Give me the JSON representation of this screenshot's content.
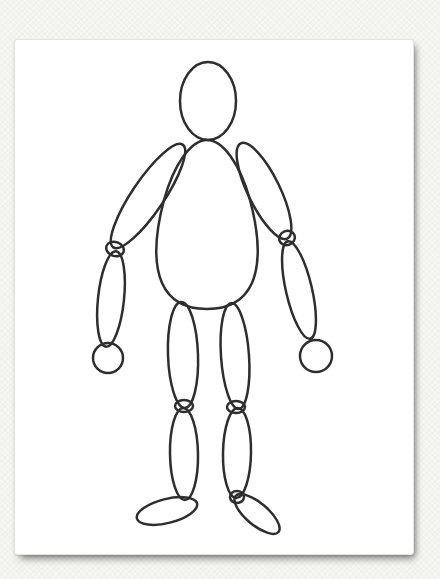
{
  "canvas": {
    "background_color": "#f7f7f4",
    "card_color": "#ffffff",
    "stroke_color": "#2e2e2e",
    "stroke_width": 2.5
  },
  "figure": {
    "parts": [
      {
        "name": "head",
        "shape": "ellipse",
        "cx": 208,
        "cy": 101,
        "rx": 28,
        "ry": 39,
        "rotate": 0
      },
      {
        "name": "torso",
        "shape": "path",
        "d": "M 207,140 C 191,140 174,164 164,200 C 156,230 153,262 162,283 C 171,303 189,309 207,309 C 225,309 243,303 252,283 C 261,262 258,230 250,200 C 240,164 223,140 207,140 Z"
      },
      {
        "name": "left-upper-arm",
        "shape": "ellipse",
        "cx": 148,
        "cy": 196,
        "rx": 16,
        "ry": 62,
        "rotate": 34
      },
      {
        "name": "right-upper-arm",
        "shape": "ellipse",
        "cx": 264,
        "cy": 191,
        "rx": 16,
        "ry": 53,
        "rotate": -26
      },
      {
        "name": "left-elbow-joint",
        "shape": "ellipse",
        "cx": 115,
        "cy": 249,
        "rx": 9,
        "ry": 7,
        "rotate": 20
      },
      {
        "name": "right-elbow-joint",
        "shape": "ellipse",
        "cx": 287,
        "cy": 238,
        "rx": 8,
        "ry": 7,
        "rotate": -20
      },
      {
        "name": "left-forearm",
        "shape": "ellipse",
        "cx": 111,
        "cy": 299,
        "rx": 13,
        "ry": 48,
        "rotate": 6
      },
      {
        "name": "right-forearm",
        "shape": "ellipse",
        "cx": 299,
        "cy": 290,
        "rx": 13,
        "ry": 50,
        "rotate": -13
      },
      {
        "name": "left-hand",
        "shape": "ellipse",
        "cx": 108,
        "cy": 358,
        "rx": 15,
        "ry": 15,
        "rotate": 0
      },
      {
        "name": "right-hand",
        "shape": "ellipse",
        "cx": 316,
        "cy": 356,
        "rx": 16,
        "ry": 16,
        "rotate": 0
      },
      {
        "name": "left-thigh",
        "shape": "ellipse",
        "cx": 183,
        "cy": 355,
        "rx": 15,
        "ry": 53,
        "rotate": -2
      },
      {
        "name": "right-thigh",
        "shape": "ellipse",
        "cx": 235,
        "cy": 356,
        "rx": 14,
        "ry": 53,
        "rotate": -4
      },
      {
        "name": "left-knee-joint",
        "shape": "ellipse",
        "cx": 184,
        "cy": 406,
        "rx": 9,
        "ry": 6,
        "rotate": 0
      },
      {
        "name": "right-knee-joint",
        "shape": "ellipse",
        "cx": 236,
        "cy": 407,
        "rx": 9,
        "ry": 6,
        "rotate": 0
      },
      {
        "name": "left-calf",
        "shape": "ellipse",
        "cx": 184,
        "cy": 454,
        "rx": 14,
        "ry": 46,
        "rotate": -1
      },
      {
        "name": "right-calf",
        "shape": "ellipse",
        "cx": 237,
        "cy": 453,
        "rx": 14,
        "ry": 45,
        "rotate": 1
      },
      {
        "name": "right-ankle-joint",
        "shape": "ellipse",
        "cx": 237,
        "cy": 497,
        "rx": 7,
        "ry": 6,
        "rotate": 0
      },
      {
        "name": "left-foot",
        "shape": "ellipse",
        "cx": 167,
        "cy": 511,
        "rx": 31,
        "ry": 12,
        "rotate": -14
      },
      {
        "name": "right-foot",
        "shape": "ellipse",
        "cx": 257,
        "cy": 514,
        "rx": 28,
        "ry": 11,
        "rotate": 40
      }
    ]
  }
}
